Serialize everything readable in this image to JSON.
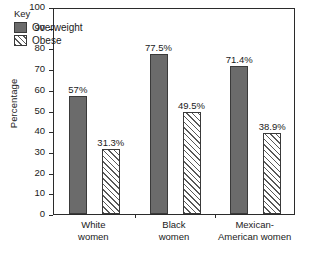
{
  "chart_data": {
    "type": "bar",
    "title": "",
    "xlabel": "",
    "ylabel": "Percentage",
    "ylim": [
      0,
      100
    ],
    "ytick_step": 10,
    "yticks": [
      100,
      90,
      80,
      70,
      60,
      50,
      40,
      30,
      20,
      10,
      0
    ],
    "grid": false,
    "legend_position": "top-left",
    "legend_title": "Key",
    "categories": [
      "White women",
      "Black women",
      "Mexican-American women"
    ],
    "category_lines": [
      [
        "White",
        "women"
      ],
      [
        "Black",
        "women"
      ],
      [
        "Mexican-",
        "American women"
      ]
    ],
    "series": [
      {
        "name": "Overweight",
        "fill": "solid",
        "color": "#6b6b6b",
        "values": [
          57,
          77.5,
          71.4
        ],
        "labels": [
          "57%",
          "77.5%",
          "71.4%"
        ]
      },
      {
        "name": "Obese",
        "fill": "hatched",
        "color": "#ffffff",
        "values": [
          31.3,
          49.5,
          38.9
        ],
        "labels": [
          "31.3%",
          "49.5%",
          "38.9%"
        ]
      }
    ]
  },
  "axis": {
    "y_title": "Percentage",
    "y_tick_labels": [
      "100",
      "90",
      "80",
      "70",
      "60",
      "50",
      "40",
      "30",
      "20",
      "10",
      "0"
    ]
  },
  "legend": {
    "title": "Key",
    "entries": [
      {
        "label": "Overweight",
        "swatch": "solid-swatch"
      },
      {
        "label": "Obese",
        "swatch": "hatched-swatch"
      }
    ]
  },
  "colors": {
    "overweight_bar": "#6b6b6b",
    "obese_bar": "#ffffff",
    "hatch_line": "#585858",
    "axis": "#2b2b2b",
    "text": "#1a1a1a",
    "background": "#ffffff"
  }
}
